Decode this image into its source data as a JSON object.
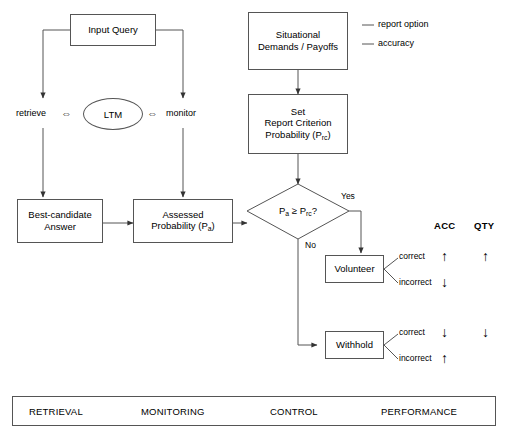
{
  "diagram": {
    "nodes": {
      "input_query": "Input Query",
      "ltm": "LTM",
      "best_candidate_l1": "Best-candidate",
      "best_candidate_l2": "Answer",
      "assessed_l1": "Assessed",
      "assessed_l2_pre": "Probability (P",
      "assessed_l2_sub": "a",
      "assessed_l2_post": ")",
      "situational_l1": "Situational",
      "situational_l2": "Demands / Payoffs",
      "criterion_l1": "Set",
      "criterion_l2": "Report Criterion",
      "criterion_l3_pre": "Probability (P",
      "criterion_l3_sub": "rc",
      "criterion_l3_post": ")",
      "volunteer": "Volunteer",
      "withhold": "Withhold"
    },
    "process_labels": {
      "retrieve": "retrieve",
      "monitor": "monitor",
      "bidi_glyph": "⇔"
    },
    "decision": {
      "expr_pre": "P",
      "expr_sub_a": "a",
      "expr_mid": " ≥ P",
      "expr_sub_rc": "rc",
      "expr_post": "?",
      "yes_label": "Yes",
      "no_label": "No"
    },
    "annotations": [
      {
        "text": "report option"
      },
      {
        "text": "accuracy"
      }
    ],
    "branch_labels": {
      "volunteer_correct": "correct",
      "volunteer_incorrect": "incorrect",
      "withhold_correct": "correct",
      "withhold_incorrect": "incorrect"
    },
    "outcome_table": {
      "headers": [
        "ACC",
        "QTY"
      ],
      "rows": [
        {
          "branch": "volunteer-correct",
          "acc": "↑",
          "qty": "↑"
        },
        {
          "branch": "volunteer-incorrect",
          "acc": "↓",
          "qty": ""
        },
        {
          "branch": "withhold-correct",
          "acc": "↓",
          "qty": "↓"
        },
        {
          "branch": "withhold-incorrect",
          "acc": "↑",
          "qty": ""
        }
      ]
    },
    "legend": {
      "items": [
        "RETRIEVAL",
        "MONITORING",
        "CONTROL",
        "PERFORMANCE"
      ]
    },
    "colors": {
      "stroke": "#555555",
      "text": "#000000",
      "background": "#ffffff"
    }
  }
}
